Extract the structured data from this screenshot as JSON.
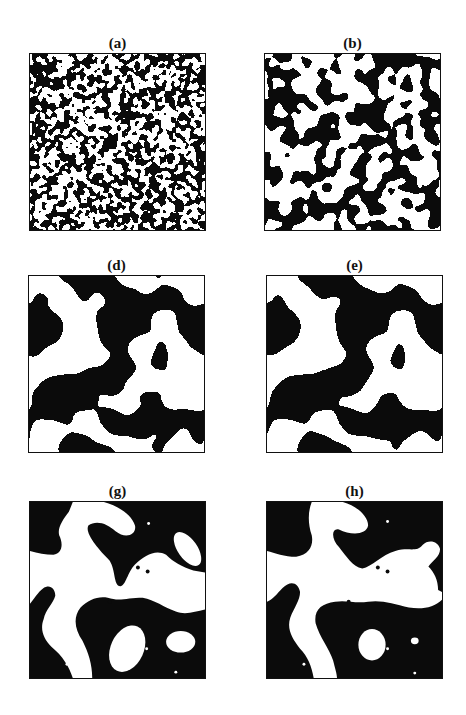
{
  "page": {
    "header_cut_text": "· · ·"
  },
  "figure": {
    "panels": [
      {
        "id": "a",
        "label": "(a)",
        "pattern": "noise",
        "scale": 1.2,
        "white_fraction": 0.5
      },
      {
        "id": "b",
        "label": "(b)",
        "pattern": "noise",
        "scale": 3.2,
        "white_fraction": 0.52
      },
      {
        "id": "d",
        "label": "(d)",
        "pattern": "noise",
        "scale": 7.5,
        "white_fraction": 0.5
      },
      {
        "id": "e",
        "label": "(e)",
        "pattern": "noise",
        "scale": 9.0,
        "white_fraction": 0.5
      },
      {
        "id": "g",
        "label": "(g)",
        "pattern": "blobs"
      },
      {
        "id": "h",
        "label": "(h)",
        "pattern": "blobs"
      }
    ],
    "colors": {
      "phase_dark": "#0b0b0b",
      "phase_light": "#ffffff",
      "frame": "#111111"
    }
  }
}
